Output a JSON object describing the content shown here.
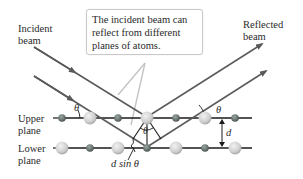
{
  "labels": {
    "incident_beam": [
      "Incident",
      "beam"
    ],
    "reflected_beam": [
      "Reflected",
      "beam"
    ],
    "upper_plane": [
      "Upper",
      "plane"
    ],
    "lower_plane": [
      "Lower",
      "plane"
    ],
    "d_sin_theta": "d sin θ",
    "d": "d",
    "theta": "θ"
  },
  "callout": {
    "lines": [
      "The incident beam can",
      "reflect from different",
      "planes of atoms."
    ]
  },
  "colors": {
    "beam": "#5a5a5a",
    "plane_line": "#1a1a1a",
    "callout_border": "#c8c8c8",
    "pointer_line": "#c0c0c0",
    "small_atom": "#6f7a78",
    "large_atom": "#d4d4d4"
  }
}
